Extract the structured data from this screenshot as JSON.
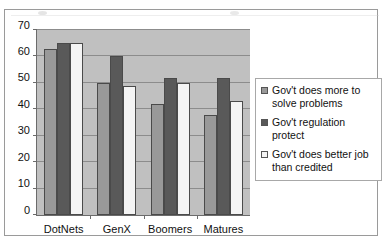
{
  "chart_data": {
    "type": "bar",
    "title": "",
    "xlabel": "",
    "ylabel": "",
    "ylim": [
      0,
      70
    ],
    "ytick_step": 10,
    "yticks": [
      0,
      10,
      20,
      30,
      40,
      50,
      60,
      70
    ],
    "grid": true,
    "legend_position": "right",
    "categories": [
      "DotNets",
      "GenX",
      "Boomers",
      "Matures"
    ],
    "series": [
      {
        "name": "Gov't does more to solve problems",
        "color": "#999999",
        "values": [
          63,
          50,
          42,
          38
        ]
      },
      {
        "name": "Gov't regulation protect",
        "color": "#595959",
        "values": [
          65,
          60,
          52,
          52
        ]
      },
      {
        "name": "Gov't does better job than credited",
        "color": "#f4f4f4",
        "values": [
          65,
          49,
          50,
          43
        ]
      }
    ]
  },
  "legend": {
    "items": [
      {
        "label": "Gov't does more to solve problems",
        "swatch": "#999999"
      },
      {
        "label": "Gov't regulation protect",
        "swatch": "#595959"
      },
      {
        "label": "Gov't does better job than credited",
        "swatch": "#f4f4f4"
      }
    ]
  },
  "plot": {
    "background": "#c0c0c0",
    "gridline_color": "#8c8c8c",
    "axis_color": "#6b6b6b"
  }
}
